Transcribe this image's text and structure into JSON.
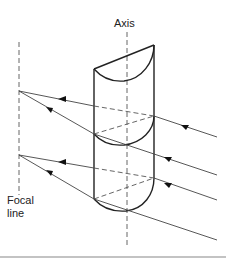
{
  "diagram": {
    "labels": {
      "axis": "Axis",
      "focal_line_1": "Focal",
      "focal_line_2": "line"
    },
    "colors": {
      "stroke": "#222222",
      "ray": "#444444",
      "background": "#ffffff"
    }
  }
}
